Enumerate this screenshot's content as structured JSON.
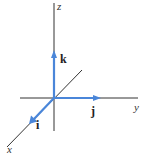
{
  "diagram": {
    "type": "3d-coordinate-axes",
    "origin": [
      54,
      98
    ],
    "colors": {
      "axis": "#333333",
      "vector": "#4a86d9",
      "label": "#222222"
    },
    "axes": {
      "x": {
        "label": "x"
      },
      "y": {
        "label": "y"
      },
      "z": {
        "label": "z"
      }
    },
    "unit_vectors": {
      "i": {
        "label": "i",
        "direction": "x"
      },
      "j": {
        "label": "j",
        "direction": "y"
      },
      "k": {
        "label": "k",
        "direction": "z"
      }
    }
  }
}
